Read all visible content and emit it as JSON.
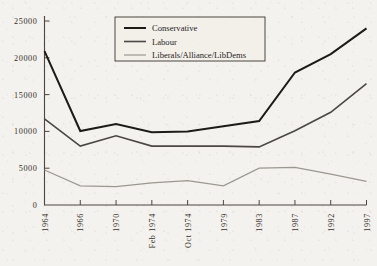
{
  "chart_data": {
    "type": "line",
    "title": "",
    "subtitle": "",
    "xlabel": "",
    "ylabel": "",
    "categories": [
      "1964",
      "1966",
      "1970",
      "Feb 1974",
      "Oct 1974",
      "1979",
      "1983",
      "1987",
      "1992",
      "1997"
    ],
    "ylim": [
      0,
      25000
    ],
    "ytick_labels": [
      "0",
      "5000",
      "10000",
      "15000",
      "20000",
      "25000"
    ],
    "ytick_values": [
      0,
      5000,
      10000,
      15000,
      20000,
      25000
    ],
    "grid": false,
    "legend_position": "top-center",
    "series": [
      {
        "name": "Conservative",
        "color": "#1d1b18",
        "width": 2.0,
        "values": [
          20900,
          10050,
          11000,
          9900,
          10000,
          10700,
          11400,
          18000,
          20500,
          24000
        ]
      },
      {
        "name": "Labour",
        "color": "#4b4843",
        "width": 1.6,
        "values": [
          11700,
          8000,
          9400,
          8000,
          8000,
          8000,
          7900,
          10100,
          12600,
          16500
        ]
      },
      {
        "name": "Liberals/Alliance/LibDems",
        "color": "#9b9890",
        "width": 1.2,
        "values": [
          4750,
          2600,
          2500,
          3000,
          3300,
          2600,
          5000,
          5100,
          4200,
          3200
        ]
      }
    ]
  },
  "legend": {
    "entries": [
      {
        "label": "Conservative"
      },
      {
        "label": "Labour"
      },
      {
        "label": "Liberals/Alliance/LibDems"
      }
    ]
  }
}
